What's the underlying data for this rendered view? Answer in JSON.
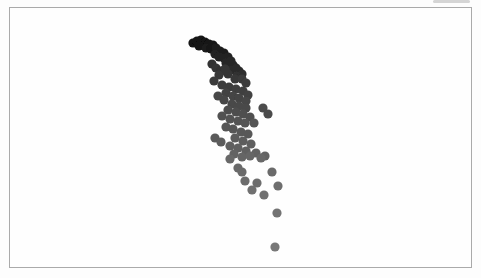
{
  "figure": {
    "background_color": "#fdfdfd",
    "frame": {
      "x": 9,
      "y": 7,
      "width": 463,
      "height": 261,
      "border_color": "#aaaaaa",
      "fill": "#fefefe"
    },
    "artifact_color": "#c7c7c7"
  },
  "chart_data": {
    "type": "scatter",
    "title": "",
    "subtitle": "",
    "xlabel": "",
    "ylabel": "",
    "axes_visible": false,
    "gridlines": false,
    "legend": false,
    "tick_labels": [],
    "point_radius": 4.6,
    "color_ramp": {
      "start": "#121212",
      "end": "#787878",
      "meaning": "points darken at top of arc, lighten toward bottom"
    },
    "coordinate_space": "pixels, origin top-left of 481x278 image",
    "points": [
      [
        193,
        43,
        "#121212"
      ],
      [
        197,
        41,
        "#141414"
      ],
      [
        201,
        40,
        "#131313"
      ],
      [
        205,
        42,
        "#121212"
      ],
      [
        209,
        44,
        "#161616"
      ],
      [
        213,
        45,
        "#151515"
      ],
      [
        199,
        46,
        "#181818"
      ],
      [
        206,
        48,
        "#1a1a1a"
      ],
      [
        211,
        49,
        "#171717"
      ],
      [
        216,
        48,
        "#1c1c1c"
      ],
      [
        220,
        51,
        "#1b1b1b"
      ],
      [
        224,
        53,
        "#1e1e1e"
      ],
      [
        215,
        54,
        "#202020"
      ],
      [
        219,
        57,
        "#232323"
      ],
      [
        224,
        58,
        "#222222"
      ],
      [
        228,
        57,
        "#242424"
      ],
      [
        231,
        61,
        "#262626"
      ],
      [
        226,
        63,
        "#282828"
      ],
      [
        233,
        65,
        "#272727"
      ],
      [
        236,
        68,
        "#2a2a2a"
      ],
      [
        231,
        70,
        "#2c2c2c"
      ],
      [
        239,
        71,
        "#2b2b2b"
      ],
      [
        242,
        74,
        "#2e2e2e"
      ],
      [
        237,
        76,
        "#303030"
      ],
      [
        212,
        64,
        "#323232"
      ],
      [
        216,
        68,
        "#343434"
      ],
      [
        221,
        71,
        "#333333"
      ],
      [
        225,
        69,
        "#353535"
      ],
      [
        219,
        75,
        "#373737"
      ],
      [
        228,
        74,
        "#363636"
      ],
      [
        235,
        79,
        "#393939"
      ],
      [
        242,
        79,
        "#3a3a3a"
      ],
      [
        246,
        83,
        "#3c3c3c"
      ],
      [
        214,
        81,
        "#3b3b3b"
      ],
      [
        222,
        85,
        "#3d3d3d"
      ],
      [
        229,
        87,
        "#3e3e3e"
      ],
      [
        236,
        89,
        "#3f3f3f"
      ],
      [
        243,
        91,
        "#414141"
      ],
      [
        248,
        95,
        "#434343"
      ],
      [
        226,
        93,
        "#424242"
      ],
      [
        233,
        96,
        "#444444"
      ],
      [
        239,
        98,
        "#454545"
      ],
      [
        246,
        101,
        "#464646"
      ],
      [
        224,
        100,
        "#474747"
      ],
      [
        218,
        96,
        "#464646"
      ],
      [
        232,
        104,
        "#484848"
      ],
      [
        239,
        106,
        "#494949"
      ],
      [
        246,
        108,
        "#4a4a4a"
      ],
      [
        263,
        108,
        "#4b4b4b"
      ],
      [
        268,
        114,
        "#4c4c4c"
      ],
      [
        228,
        110,
        "#4d4d4d"
      ],
      [
        236,
        112,
        "#4e4e4e"
      ],
      [
        243,
        114,
        "#4f4f4f"
      ],
      [
        250,
        117,
        "#505050"
      ],
      [
        222,
        116,
        "#515151"
      ],
      [
        230,
        119,
        "#525252"
      ],
      [
        238,
        121,
        "#535353"
      ],
      [
        245,
        123,
        "#545454"
      ],
      [
        254,
        123,
        "#555555"
      ],
      [
        226,
        127,
        "#565656"
      ],
      [
        233,
        129,
        "#575757"
      ],
      [
        241,
        132,
        "#585858"
      ],
      [
        248,
        134,
        "#595959"
      ],
      [
        215,
        138,
        "#5a5a5a"
      ],
      [
        221,
        142,
        "#5b5b5b"
      ],
      [
        235,
        138,
        "#5c5c5c"
      ],
      [
        243,
        141,
        "#5d5d5d"
      ],
      [
        251,
        144,
        "#5e5e5e"
      ],
      [
        230,
        146,
        "#5f5f5f"
      ],
      [
        238,
        148,
        "#606060"
      ],
      [
        246,
        151,
        "#616161"
      ],
      [
        256,
        153,
        "#626262"
      ],
      [
        234,
        154,
        "#636363"
      ],
      [
        265,
        156,
        "#646464"
      ],
      [
        242,
        157,
        "#656565"
      ],
      [
        250,
        156,
        "#666666"
      ],
      [
        261,
        158,
        "#676767"
      ],
      [
        230,
        159,
        "#686868"
      ],
      [
        238,
        168,
        "#696969"
      ],
      [
        242,
        172,
        "#6a6a6a"
      ],
      [
        272,
        172,
        "#6b6b6b"
      ],
      [
        245,
        181,
        "#6c6c6c"
      ],
      [
        257,
        183,
        "#6d6d6d"
      ],
      [
        278,
        186,
        "#6e6e6e"
      ],
      [
        252,
        190,
        "#6f6f6f"
      ],
      [
        264,
        195,
        "#707070"
      ],
      [
        277,
        213,
        "#737373"
      ],
      [
        275,
        247,
        "#787878"
      ]
    ]
  }
}
